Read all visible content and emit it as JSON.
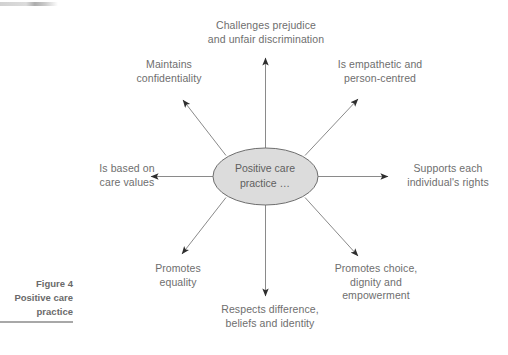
{
  "figure": {
    "caption": "Figure 4\nPositive care\npractice",
    "caption_rule_color": "#a8a8a8"
  },
  "diagram": {
    "type": "radial-spoke",
    "center": {
      "text": "Positive care\npractice …",
      "fill": "#dcdcdc",
      "stroke": "#6e6e6e"
    },
    "arrow_color": "#8a8a8a",
    "arrowhead_color": "#333333",
    "text_color": "#6e6e6e",
    "nodes": [
      {
        "id": "challenges-prejudice",
        "text": "Challenges prejudice\nand unfair discrimination",
        "direction": "up"
      },
      {
        "id": "is-empathetic",
        "text": "Is empathetic and\nperson-centred",
        "direction": "up-right"
      },
      {
        "id": "supports-rights",
        "text": "Supports each\nindividual's rights",
        "direction": "right"
      },
      {
        "id": "promotes-choice",
        "text": "Promotes choice,\ndignity and\nempowerment",
        "direction": "down-right"
      },
      {
        "id": "respects-difference",
        "text": "Respects difference,\nbeliefs and identity",
        "direction": "down"
      },
      {
        "id": "promotes-equality",
        "text": "Promotes\nequality",
        "direction": "down-left"
      },
      {
        "id": "is-based-on-care-values",
        "text": "Is based on\ncare values",
        "direction": "left"
      },
      {
        "id": "maintains-confidentiality",
        "text": "Maintains\nconfidentiality",
        "direction": "up-left"
      }
    ]
  }
}
